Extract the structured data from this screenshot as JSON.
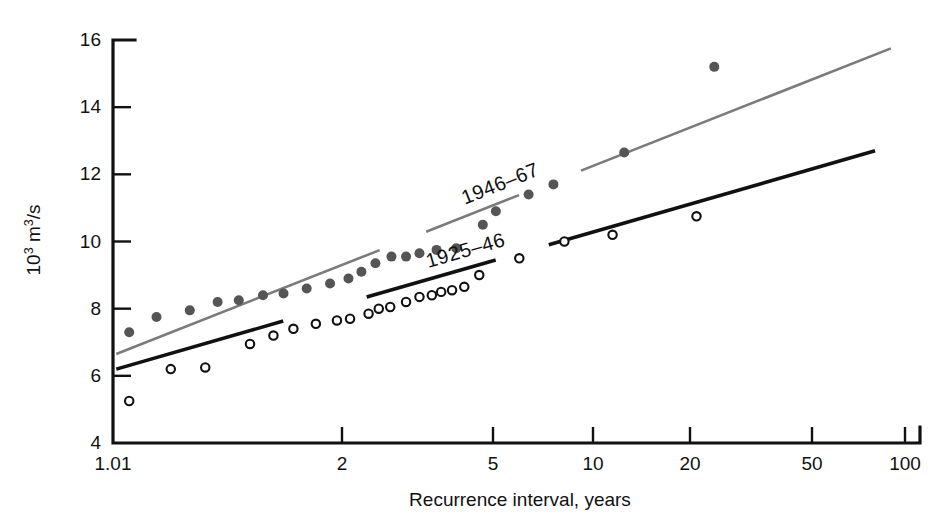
{
  "chart_data": {
    "type": "scatter",
    "title": "",
    "xlabel": "Recurrence interval, years",
    "ylabel": "10³ m³/s",
    "ylabel_parts": {
      "base1": "10",
      "exp1": "3",
      "mid": " m",
      "exp2": "3",
      "tail": "/s"
    },
    "xscale": "gumbel-probability",
    "yscale": "linear",
    "ylim": [
      4,
      16
    ],
    "yticks": [
      4,
      6,
      8,
      10,
      12,
      14,
      16
    ],
    "ytick_labels": [
      "4",
      "6",
      "8",
      "10",
      "12",
      "14",
      "16"
    ],
    "xticks": [
      1.01,
      2,
      5,
      10,
      20,
      50,
      100
    ],
    "xtick_labels": [
      "1.01",
      "2",
      "5",
      "10",
      "20",
      "50",
      "100"
    ],
    "xtick_px": [
      113,
      342,
      493,
      593,
      690,
      812,
      905
    ],
    "grid": false,
    "legend": "inline-annotation",
    "series": [
      {
        "name": "1946–67",
        "marker": "filled-circle",
        "color": "#555555",
        "line_color": "#7b7b7b",
        "label_text": "1946–67",
        "points": [
          {
            "x": 1.06,
            "y": 7.3
          },
          {
            "x": 1.15,
            "y": 7.75
          },
          {
            "x": 1.27,
            "y": 7.95
          },
          {
            "x": 1.38,
            "y": 8.2
          },
          {
            "x": 1.47,
            "y": 8.25
          },
          {
            "x": 1.58,
            "y": 8.4
          },
          {
            "x": 1.68,
            "y": 8.45
          },
          {
            "x": 1.8,
            "y": 8.6
          },
          {
            "x": 1.93,
            "y": 8.75
          },
          {
            "x": 2.08,
            "y": 8.9
          },
          {
            "x": 2.25,
            "y": 9.1
          },
          {
            "x": 2.45,
            "y": 9.35
          },
          {
            "x": 2.7,
            "y": 9.55
          },
          {
            "x": 2.95,
            "y": 9.55
          },
          {
            "x": 3.2,
            "y": 9.65
          },
          {
            "x": 3.55,
            "y": 9.75
          },
          {
            "x": 4.0,
            "y": 9.8
          },
          {
            "x": 4.7,
            "y": 10.5
          },
          {
            "x": 5.1,
            "y": 10.9
          },
          {
            "x": 6.4,
            "y": 11.4
          },
          {
            "x": 7.6,
            "y": 11.7
          },
          {
            "x": 12.5,
            "y": 12.65
          },
          {
            "x": 24.0,
            "y": 15.2
          }
        ],
        "trend": {
          "x1": 1.02,
          "y1": 6.65,
          "x2": 90,
          "y2": 15.75
        }
      },
      {
        "name": "1925–46",
        "marker": "open-circle",
        "color": "#111111",
        "line_color": "#111111",
        "label_text": "1925–46",
        "points": [
          {
            "x": 1.06,
            "y": 5.25
          },
          {
            "x": 1.2,
            "y": 6.2
          },
          {
            "x": 1.33,
            "y": 6.25
          },
          {
            "x": 1.52,
            "y": 6.95
          },
          {
            "x": 1.63,
            "y": 7.2
          },
          {
            "x": 1.73,
            "y": 7.4
          },
          {
            "x": 1.85,
            "y": 7.55
          },
          {
            "x": 1.97,
            "y": 7.65
          },
          {
            "x": 2.1,
            "y": 7.7
          },
          {
            "x": 2.35,
            "y": 7.85
          },
          {
            "x": 2.5,
            "y": 8.0
          },
          {
            "x": 2.68,
            "y": 8.05
          },
          {
            "x": 2.95,
            "y": 8.2
          },
          {
            "x": 3.2,
            "y": 8.35
          },
          {
            "x": 3.45,
            "y": 8.4
          },
          {
            "x": 3.65,
            "y": 8.5
          },
          {
            "x": 3.9,
            "y": 8.55
          },
          {
            "x": 4.2,
            "y": 8.65
          },
          {
            "x": 4.6,
            "y": 9.0
          },
          {
            "x": 6.0,
            "y": 9.5
          },
          {
            "x": 8.2,
            "y": 10.0
          },
          {
            "x": 11.5,
            "y": 10.2
          },
          {
            "x": 21.0,
            "y": 10.75
          }
        ],
        "trend": {
          "x1": 1.02,
          "y1": 6.2,
          "x2": 80,
          "y2": 12.7
        }
      }
    ]
  },
  "axis": {
    "x_title": "Recurrence interval, years",
    "y_title": "10³ m³/s"
  }
}
